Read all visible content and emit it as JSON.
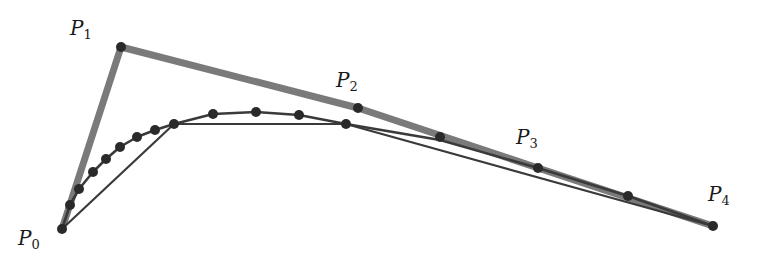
{
  "diagram": {
    "type": "de-casteljau-bezier",
    "colors": {
      "control_polygon": "#7a7a7a",
      "curve": "#3a3a3a",
      "dot": "#2a2a2a",
      "background": "#ffffff"
    },
    "control_points": [
      {
        "name": "P",
        "sub": "0",
        "x": 62,
        "y": 229,
        "label_x": 18,
        "label_y": 228
      },
      {
        "name": "P",
        "sub": "1",
        "x": 121,
        "y": 47,
        "label_x": 70,
        "label_y": 18
      },
      {
        "name": "P",
        "sub": "2",
        "x": 358,
        "y": 108,
        "label_x": 336,
        "label_y": 70
      },
      {
        "name": "P",
        "sub": "3",
        "x": 538,
        "y": 168,
        "label_x": 516,
        "label_y": 127
      },
      {
        "name": "P",
        "sub": "4",
        "x": 713,
        "y": 226,
        "label_x": 708,
        "label_y": 184
      }
    ],
    "inner_polygon": [
      [
        62,
        229
      ],
      [
        174,
        124
      ],
      [
        346,
        124
      ],
      [
        713,
        226
      ]
    ],
    "curve_points": [
      [
        62,
        229
      ],
      [
        70,
        205
      ],
      [
        79,
        189
      ],
      [
        93,
        172
      ],
      [
        106,
        159
      ],
      [
        120,
        147
      ],
      [
        137,
        137
      ],
      [
        155,
        130
      ],
      [
        174,
        124
      ],
      [
        213,
        114
      ],
      [
        256,
        112
      ],
      [
        299,
        115
      ],
      [
        346,
        124
      ],
      [
        440,
        140
      ],
      [
        538,
        168
      ],
      [
        628,
        196
      ],
      [
        713,
        226
      ]
    ],
    "dots": [
      [
        62,
        229
      ],
      [
        70,
        205
      ],
      [
        79,
        189
      ],
      [
        93,
        172
      ],
      [
        106,
        159
      ],
      [
        120,
        147
      ],
      [
        137,
        137
      ],
      [
        155,
        130
      ],
      [
        174,
        124
      ],
      [
        213,
        114
      ],
      [
        256,
        112
      ],
      [
        299,
        115
      ],
      [
        346,
        124
      ],
      [
        358,
        108
      ],
      [
        440,
        137
      ],
      [
        538,
        168
      ],
      [
        628,
        196
      ],
      [
        713,
        226
      ],
      [
        121,
        47
      ]
    ]
  }
}
